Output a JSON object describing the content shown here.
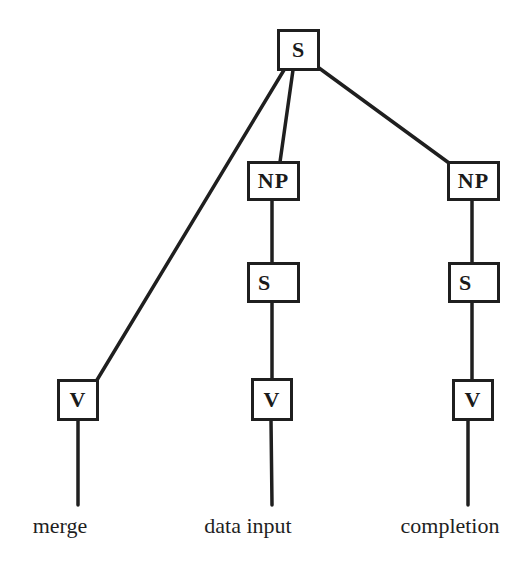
{
  "diagram": {
    "type": "syntax-tree",
    "nodes": [
      {
        "id": "root",
        "label": "S"
      },
      {
        "id": "np1",
        "label": "NP"
      },
      {
        "id": "np2",
        "label": "NP"
      },
      {
        "id": "s1",
        "label": "S"
      },
      {
        "id": "s2",
        "label": "S"
      },
      {
        "id": "v0",
        "label": "V"
      },
      {
        "id": "v1",
        "label": "V"
      },
      {
        "id": "v2",
        "label": "V"
      }
    ],
    "edges": [
      [
        "root",
        "v0"
      ],
      [
        "root",
        "np1"
      ],
      [
        "root",
        "np2"
      ],
      [
        "np1",
        "s1"
      ],
      [
        "s1",
        "v1"
      ],
      [
        "np2",
        "s2"
      ],
      [
        "s2",
        "v2"
      ],
      [
        "v0",
        "merge"
      ],
      [
        "v1",
        "data input"
      ],
      [
        "v2",
        "completion"
      ]
    ],
    "leaves": [
      {
        "label": "merge"
      },
      {
        "label": "data input"
      },
      {
        "label": "completion"
      }
    ]
  }
}
